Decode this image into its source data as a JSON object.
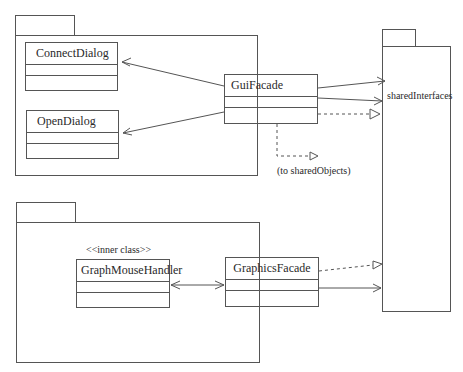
{
  "diagram": {
    "type": "UML class diagram",
    "packages": [
      {
        "id": "gui-package",
        "label": ""
      },
      {
        "id": "graphics-package",
        "label": ""
      },
      {
        "id": "shared-interfaces-package",
        "label": "sharedInterfaces"
      }
    ],
    "classes": [
      {
        "id": "connect-dialog",
        "name": "ConnectDialog"
      },
      {
        "id": "open-dialog",
        "name": "OpenDialog"
      },
      {
        "id": "gui-facade",
        "name": "GuiFacade"
      },
      {
        "id": "graph-mouse-handler",
        "name": "GraphMouseHandler",
        "stereotype": "<<inner class>>"
      },
      {
        "id": "graphics-facade",
        "name": "GraphicsFacade"
      }
    ],
    "notes": {
      "to_shared_objects": "(to sharedObjects)"
    },
    "relationships": [
      {
        "from": "GuiFacade",
        "to": "ConnectDialog",
        "kind": "association (navigable)"
      },
      {
        "from": "GuiFacade",
        "to": "OpenDialog",
        "kind": "association (navigable)"
      },
      {
        "from": "GuiFacade",
        "to": "sharedInterfaces",
        "kind": "association (navigable)"
      },
      {
        "from": "GuiFacade",
        "to": "sharedInterfaces",
        "kind": "association (navigable)"
      },
      {
        "from": "GuiFacade",
        "to": "sharedInterfaces",
        "kind": "realization (dashed)"
      },
      {
        "from": "GuiFacade",
        "to": "sharedObjects",
        "kind": "realization (dashed)"
      },
      {
        "from": "GraphMouseHandler",
        "to": "GraphicsFacade",
        "kind": "bidirectional association"
      },
      {
        "from": "GraphicsFacade",
        "to": "sharedInterfaces",
        "kind": "realization (dashed)"
      },
      {
        "from": "GraphicsFacade",
        "to": "sharedInterfaces",
        "kind": "association (navigable)"
      }
    ],
    "colors": {
      "line": "#555555",
      "background": "#ffffff",
      "text": "#2a2a2a"
    }
  }
}
